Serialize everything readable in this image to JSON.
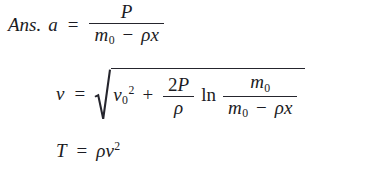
{
  "document": {
    "kind": "math-answer-block",
    "background_color": "#ffffff",
    "text_color": "#1b1b23",
    "answer_label": "Ans."
  },
  "symbols": {
    "equals": "=",
    "minus": "−",
    "plus": "+",
    "rho": "ρ",
    "ln": "ln",
    "x": "x",
    "two": "2",
    "zero": "0",
    "exp_two": "2"
  },
  "equations": [
    {
      "id": "acceleration",
      "label": "Ans.",
      "lhs": "a",
      "relation": "=",
      "rhs_description": "P divided by (m0 minus rho x)",
      "fraction": {
        "numerator": "P",
        "denominator": {
          "first": "m",
          "first_sub": "0",
          "operator": "−",
          "second_rho": "ρ",
          "second_var": "x"
        }
      }
    },
    {
      "id": "velocity",
      "lhs": "v",
      "relation": "=",
      "rhs_description": "square root of ( v0 squared + (2P/rho) ln ( m0 / (m0 minus rho x) ) )",
      "radicand": {
        "term1_base": "v",
        "term1_sub": "0",
        "term1_exp": "2",
        "plus": "+",
        "coef_fraction": {
          "numerator_number": "2",
          "numerator_var": "P",
          "denominator": "ρ"
        },
        "log_operator": "ln",
        "log_fraction": {
          "numerator_base": "m",
          "numerator_sub": "0",
          "denominator_base": "m",
          "denominator_sub": "0",
          "denominator_operator": "−",
          "denominator_rho": "ρ",
          "denominator_var": "x"
        }
      }
    },
    {
      "id": "thrust",
      "lhs": "T",
      "relation": "=",
      "rhs_description": "rho times v squared",
      "rhs": {
        "rho": "ρ",
        "base": "v",
        "exponent": "2"
      }
    }
  ]
}
